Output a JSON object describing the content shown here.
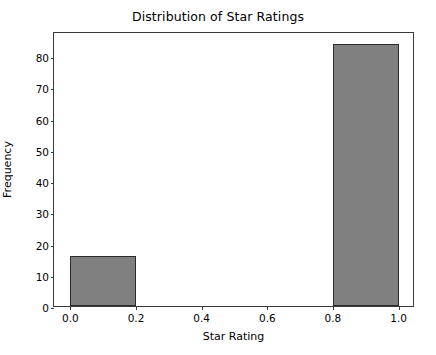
{
  "chart_data": {
    "type": "bar",
    "title": "Distribution of Star Ratings",
    "xlabel": "Star Rating",
    "ylabel": "Frequency",
    "xlim": [
      -0.05,
      1.05
    ],
    "ylim": [
      0,
      88
    ],
    "grid": false,
    "legend": null,
    "bar_color": "#808080",
    "edge_color": "#2b2b2b",
    "bin_edges": [
      0.0,
      0.2,
      0.4,
      0.6,
      0.8,
      1.0
    ],
    "categories": [
      "0.0-0.2",
      "0.2-0.4",
      "0.4-0.6",
      "0.6-0.8",
      "0.8-1.0"
    ],
    "values": [
      16,
      0,
      0,
      0,
      84
    ],
    "bars": [
      {
        "x_start": 0.0,
        "x_end": 0.2,
        "value": 16
      },
      {
        "x_start": 0.2,
        "x_end": 0.4,
        "value": 0
      },
      {
        "x_start": 0.4,
        "x_end": 0.6,
        "value": 0
      },
      {
        "x_start": 0.6,
        "x_end": 0.8,
        "value": 0
      },
      {
        "x_start": 0.8,
        "x_end": 1.0,
        "value": 84
      }
    ],
    "xticks": [
      0.0,
      0.2,
      0.4,
      0.6,
      0.8,
      1.0
    ],
    "xtick_labels": [
      "0.0",
      "0.2",
      "0.4",
      "0.6",
      "0.8",
      "1.0"
    ],
    "yticks": [
      0,
      10,
      20,
      30,
      40,
      50,
      60,
      70,
      80
    ],
    "ytick_labels": [
      "0",
      "10",
      "20",
      "30",
      "40",
      "50",
      "60",
      "70",
      "80"
    ]
  }
}
